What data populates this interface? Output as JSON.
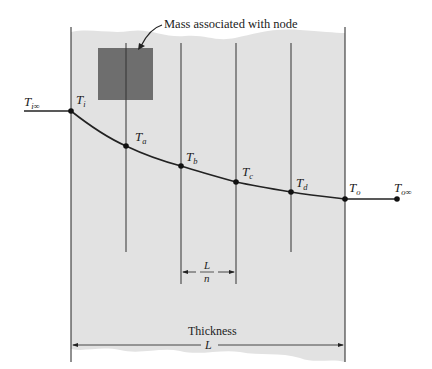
{
  "diagram": {
    "annotation": "Mass associated with node",
    "thickness_label": "Thickness",
    "thickness_symbol": "L",
    "spacing": {
      "numerator": "L",
      "denominator": "n"
    },
    "ambient_left": {
      "base": "T",
      "sub": "i∞"
    },
    "ambient_right": {
      "base": "T",
      "sub": "o∞"
    },
    "nodes": [
      {
        "id": "i",
        "base": "T",
        "sub": "i"
      },
      {
        "id": "a",
        "base": "T",
        "sub": "a"
      },
      {
        "id": "b",
        "base": "T",
        "sub": "b"
      },
      {
        "id": "c",
        "base": "T",
        "sub": "c"
      },
      {
        "id": "d",
        "base": "T",
        "sub": "d"
      },
      {
        "id": "o",
        "base": "T",
        "sub": "o"
      }
    ],
    "colors": {
      "wall_fill": "#e2e2e2",
      "mass_block": "#6e6e6e",
      "line": "#222222"
    }
  }
}
